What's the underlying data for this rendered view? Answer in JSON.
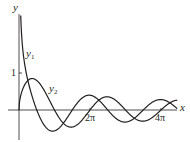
{
  "chart_data": {
    "type": "line",
    "title": "",
    "xlabel": "x",
    "ylabel": "y",
    "x_ticks": [
      {
        "value": 6.2832,
        "label": "2π"
      },
      {
        "value": 12.5664,
        "label": "4π"
      }
    ],
    "y_ticks": [
      {
        "value": 1,
        "label": "1"
      }
    ],
    "xlim": [
      -1,
      14.5
    ],
    "ylim": [
      -0.8,
      2.6
    ],
    "grid": false,
    "legend": "inline labels",
    "series": [
      {
        "name": "y1",
        "label": "y₁",
        "formula": "cos(x)/sqrt(x)",
        "x_start": 0.15,
        "x_end": 14.0
      },
      {
        "name": "y2",
        "label": "y₂",
        "formula": "sin(x)/sqrt(x)",
        "x_start": 0.0,
        "x_end": 14.0
      }
    ]
  },
  "labels": {
    "y_axis": "y",
    "x_axis": "x",
    "y1_name": "y",
    "y1_sub": "1",
    "y2_name": "y",
    "y2_sub": "2",
    "tick_1": "1",
    "tick_2pi": "2π",
    "tick_4pi": "4π"
  },
  "colors": {
    "curve": "#231f20",
    "axis": "#231f20",
    "background": "#ffffff"
  }
}
